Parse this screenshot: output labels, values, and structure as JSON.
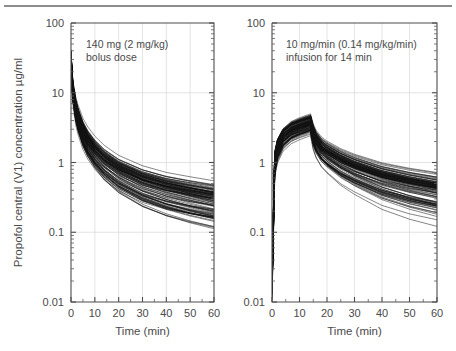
{
  "figure": {
    "background": "#ffffff",
    "rule_color": "#8d8d8d",
    "curve_color": "#111111",
    "grid_color": "#d8d8d8",
    "axis_color": "#4d4d4d",
    "text_color": "#4a4a4a",
    "shared_ylabel": "Propofol central (V1) concentration µg/ml",
    "shared_xlabel": "Time (min)"
  },
  "chart_data": [
    {
      "type": "line",
      "panel": "left",
      "title": "",
      "annotation": [
        "140 mg (2 mg/kg)",
        "bolus dose"
      ],
      "dose_mg": 140,
      "dose_mg_per_kg": 2,
      "regimen": "bolus",
      "xlabel": "Time (min)",
      "ylabel": "Propofol central (V1) concentration µg/ml",
      "xlim": [
        0,
        60
      ],
      "ylim": [
        0.01,
        100
      ],
      "yscale": "log",
      "xticks": [
        0,
        10,
        20,
        30,
        40,
        50,
        60
      ],
      "xticklabels": [
        "0",
        "10",
        "20",
        "30",
        "40",
        "50",
        "60"
      ],
      "yticks": [
        0.01,
        0.1,
        1,
        10,
        100
      ],
      "yticklabels": [
        "0.01",
        "0.1",
        "1",
        "10",
        "100"
      ],
      "grid": true,
      "legend": "none",
      "n_curves": 100,
      "series_description": "Simulated population pharmacokinetic central-compartment concentration-time profiles after a single 140 mg (2 mg/kg) propofol bolus; each faint black line is one simulated individual.",
      "envelope": {
        "x": [
          0,
          0.5,
          1,
          2,
          3,
          5,
          7,
          10,
          14,
          20,
          30,
          40,
          50,
          60
        ],
        "median": [
          35,
          14,
          9.5,
          5.8,
          4.2,
          2.7,
          2.0,
          1.45,
          1.05,
          0.76,
          0.53,
          0.42,
          0.35,
          0.3
        ],
        "upper": [
          42,
          20,
          14,
          9.0,
          6.8,
          4.4,
          3.3,
          2.4,
          1.75,
          1.25,
          0.88,
          0.7,
          0.6,
          0.52
        ],
        "lower": [
          26,
          8.5,
          5.4,
          3.0,
          2.1,
          1.25,
          0.88,
          0.6,
          0.4,
          0.26,
          0.165,
          0.125,
          0.105,
          0.092
        ]
      }
    },
    {
      "type": "line",
      "panel": "right",
      "title": "",
      "annotation": [
        "10 mg/min (0.14 mg/kg/min)",
        "infusion for 14 min"
      ],
      "rate_mg_per_min": 10,
      "rate_mg_per_kg_per_min": 0.14,
      "infusion_duration_min": 14,
      "regimen": "infusion",
      "xlabel": "Time (min)",
      "ylabel": "Propofol central (V1) concentration µg/ml",
      "xlim": [
        0,
        60
      ],
      "ylim": [
        0.01,
        100
      ],
      "yscale": "log",
      "xticks": [
        0,
        10,
        20,
        30,
        40,
        50,
        60
      ],
      "xticklabels": [
        "0",
        "10",
        "20",
        "30",
        "40",
        "50",
        "60"
      ],
      "yticks": [
        0.01,
        0.1,
        1,
        10,
        100
      ],
      "yticklabels": [
        "0.01",
        "0.1",
        "1",
        "10",
        "100"
      ],
      "grid": true,
      "legend": "none",
      "n_curves": 100,
      "series_description": "Simulated population pharmacokinetic central-compartment concentration-time profiles during and after a 10 mg/min (0.14 mg/kg/min) propofol infusion given for 14 min; each faint black line is one simulated individual.",
      "envelope": {
        "x": [
          0,
          1,
          2,
          4,
          7,
          10,
          14,
          15,
          16,
          18,
          20,
          25,
          30,
          40,
          50,
          60
        ],
        "median": [
          0.02,
          1.05,
          1.65,
          2.35,
          2.95,
          3.3,
          3.7,
          2.55,
          2.05,
          1.6,
          1.38,
          1.05,
          0.85,
          0.62,
          0.5,
          0.42
        ],
        "upper": [
          0.04,
          1.75,
          2.6,
          3.6,
          4.5,
          5.0,
          5.6,
          4.0,
          3.2,
          2.5,
          2.15,
          1.65,
          1.35,
          1.0,
          0.82,
          0.7
        ],
        "lower": [
          0.01,
          0.6,
          0.95,
          1.4,
          1.8,
          2.05,
          2.35,
          1.45,
          1.12,
          0.82,
          0.68,
          0.46,
          0.35,
          0.22,
          0.165,
          0.135
        ]
      }
    }
  ]
}
